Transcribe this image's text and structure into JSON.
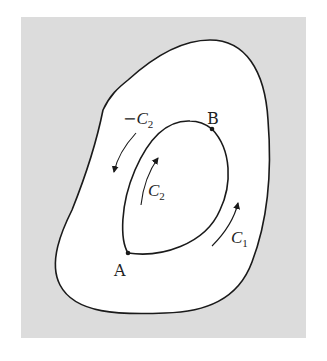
{
  "figure": {
    "background_color": "#dcdcdc",
    "region_color": "#ffffff",
    "stroke_color": "#1a1a1a",
    "points": [
      {
        "id": "A",
        "label": "A"
      },
      {
        "id": "B",
        "label": "B"
      }
    ],
    "curves": [
      {
        "id": "C1",
        "label": "C",
        "subscript": "1",
        "prefix": "",
        "direction": "counterclockwise-up"
      },
      {
        "id": "C2",
        "label": "C",
        "subscript": "2",
        "prefix": "",
        "direction": "up-left side"
      },
      {
        "id": "neg-C2",
        "label": "C",
        "subscript": "2",
        "prefix": "−",
        "direction": "down-left side"
      }
    ]
  }
}
